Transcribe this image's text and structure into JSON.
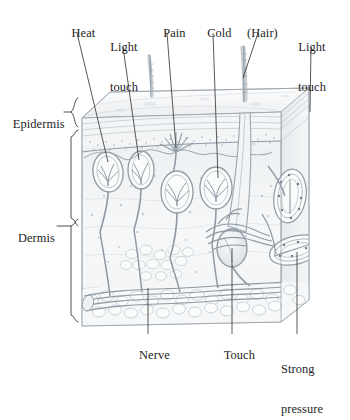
{
  "figure": {
    "ink_color": "#8e99a3",
    "text_color": "#232323",
    "background": "#ffffff"
  },
  "labels_top": [
    {
      "id": "heat",
      "text": "Heat",
      "line1": "Heat",
      "line2": ""
    },
    {
      "id": "light-touch-left",
      "text": "Light touch",
      "line1": "Light",
      "line2": "touch"
    },
    {
      "id": "pain",
      "text": "Pain",
      "line1": "Pain",
      "line2": ""
    },
    {
      "id": "cold",
      "text": "Cold",
      "line1": "Cold",
      "line2": ""
    },
    {
      "id": "hair",
      "text": "(Hair)",
      "line1": "(Hair)",
      "line2": ""
    },
    {
      "id": "light-touch-right",
      "text": "Light touch",
      "line1": "Light",
      "line2": "touch"
    }
  ],
  "labels_left": [
    {
      "id": "epidermis",
      "text": "Epidermis"
    },
    {
      "id": "dermis",
      "text": "Dermis"
    }
  ],
  "labels_bottom": [
    {
      "id": "nerve",
      "text": "Nerve",
      "line1": "Nerve",
      "line2": ""
    },
    {
      "id": "touch",
      "text": "Touch",
      "line1": "Touch",
      "line2": ""
    },
    {
      "id": "strong-pressure",
      "text": "Strong pressure",
      "line1": "Strong",
      "line2": "pressure"
    }
  ],
  "structures": [
    {
      "id": "hair-shaft-small",
      "name": "hair shaft (small)"
    },
    {
      "id": "hair-shaft-large",
      "name": "hair shaft (large)"
    },
    {
      "id": "free-nerve-ending",
      "name": "free nerve ending"
    },
    {
      "id": "ruffini-ending",
      "name": "bulbous corpuscle"
    },
    {
      "id": "krause-end-bulb",
      "name": "end bulb"
    },
    {
      "id": "pacinian-corpuscle-upper",
      "name": "lamellar corpuscle (upper)"
    },
    {
      "id": "pacinian-corpuscle-lower",
      "name": "lamellar corpuscle (lower)"
    },
    {
      "id": "nerve-trunk",
      "name": "nerve trunk"
    },
    {
      "id": "subcutaneous-fat",
      "name": "subcutaneous fat layer"
    }
  ]
}
